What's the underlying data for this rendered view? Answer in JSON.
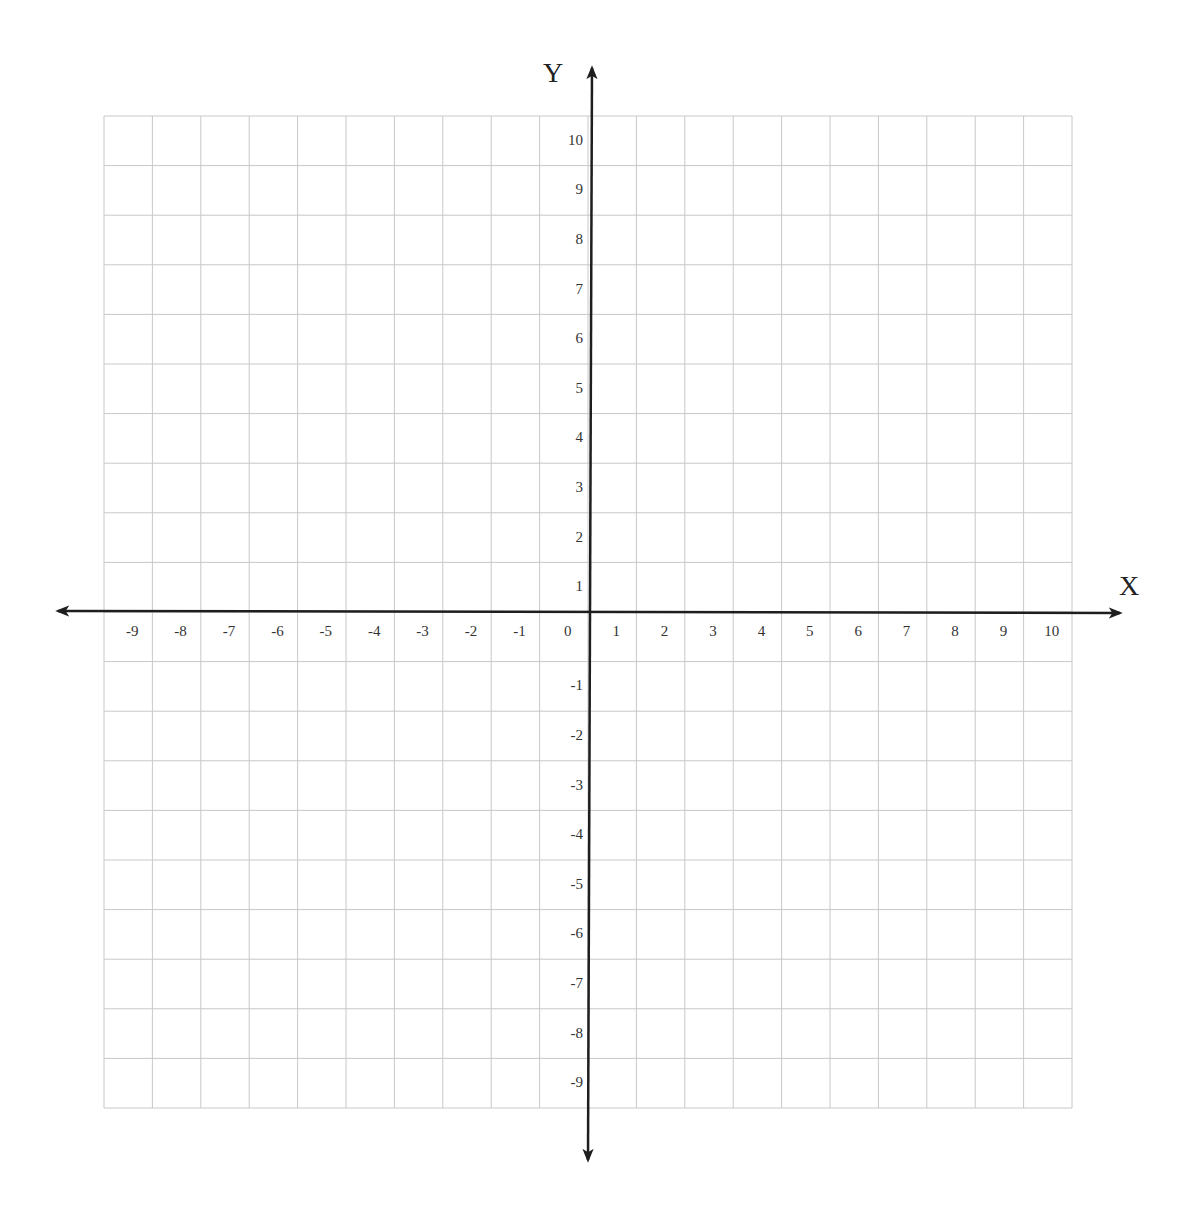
{
  "chart_data": {
    "type": "scatter",
    "title": "",
    "xlabel": "X",
    "ylabel": "Y",
    "xlim": [
      -10,
      10
    ],
    "ylim": [
      -10,
      10
    ],
    "grid": true,
    "x_tick_labels": [
      "-9",
      "-8",
      "-7",
      "-6",
      "-5",
      "-4",
      "-3",
      "-2",
      "-1",
      "0",
      "1",
      "2",
      "3",
      "4",
      "5",
      "6",
      "7",
      "8",
      "9",
      "10"
    ],
    "y_tick_labels": [
      "10",
      "9",
      "8",
      "7",
      "6",
      "5",
      "4",
      "3",
      "2",
      "1",
      "-1",
      "-2",
      "-3",
      "-4",
      "-5",
      "-6",
      "-7",
      "-8",
      "-9"
    ],
    "series": []
  },
  "colors": {
    "grid": "#c8c8c8",
    "axis": "#1e1e1e",
    "text": "#333333"
  }
}
